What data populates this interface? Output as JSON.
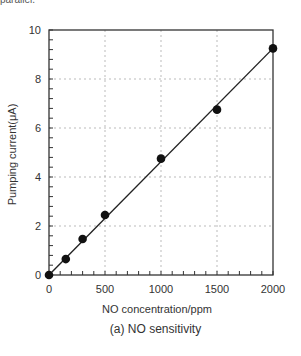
{
  "top_fragment": "parallel.",
  "caption": "(a) NO sensitivity",
  "chart_data": {
    "type": "scatter",
    "title": "",
    "xlabel": "NO concentration/ppm",
    "ylabel": "Pumping current(μA)",
    "xlim": [
      0,
      2000
    ],
    "ylim": [
      0,
      10
    ],
    "x_ticks": [
      0,
      500,
      1000,
      1500,
      2000
    ],
    "y_ticks": [
      0,
      2,
      4,
      6,
      8,
      10
    ],
    "x_minor_step": 100,
    "y_minor_step": 0.4,
    "grid": true,
    "grid_style": "dotted",
    "legend": null,
    "series": [
      {
        "name": "Measured",
        "marker": "filled-circle",
        "x": [
          0,
          150,
          300,
          500,
          1000,
          1500,
          2000
        ],
        "y": [
          0,
          0.65,
          1.47,
          2.45,
          4.75,
          6.75,
          9.25
        ]
      },
      {
        "name": "Linear fit",
        "style": "line",
        "x": [
          0,
          2000
        ],
        "y": [
          0,
          9.25
        ]
      }
    ]
  }
}
